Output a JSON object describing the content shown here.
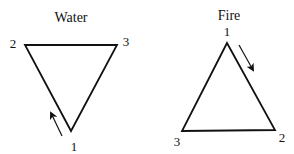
{
  "diagrams": [
    {
      "title": "Water",
      "vertices": [
        {
          "label": "1",
          "position": "bottom"
        },
        {
          "label": "2",
          "position": "top-left"
        },
        {
          "label": "3",
          "position": "top-right"
        }
      ],
      "orientation": "inverted",
      "arrow": "pointing up-left along left edge from vertex 1 toward vertex 2"
    },
    {
      "title": "Fire",
      "vertices": [
        {
          "label": "1",
          "position": "top"
        },
        {
          "label": "2",
          "position": "bottom-right"
        },
        {
          "label": "3",
          "position": "bottom-left"
        }
      ],
      "orientation": "upright",
      "arrow": "pointing down-right along right edge from vertex 1 toward vertex 2"
    }
  ],
  "colors": {
    "stroke": "#111111",
    "background": "#ffffff"
  }
}
